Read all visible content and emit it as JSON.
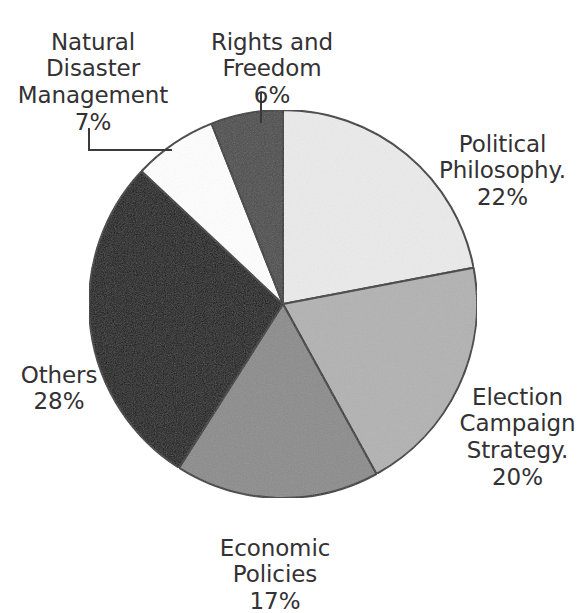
{
  "chart_data": {
    "type": "pie",
    "title": "",
    "subtitle": "",
    "xlabel": "",
    "ylabel": "",
    "legend_position": "none",
    "grid": false,
    "units": "percent",
    "start_angle_deg": 0,
    "direction": "clockwise",
    "categories": [
      "Political Philosophy.",
      "Election Campaign Strategy.",
      "Economic Policies",
      "Others",
      "Natural Disaster Management",
      "Rights and Freedom"
    ],
    "values": [
      22,
      20,
      17,
      28,
      7,
      6
    ],
    "slices": [
      {
        "id": "political-philosophy",
        "label": "Political Philosophy.",
        "percent_text": "22%",
        "value": 22,
        "color": "#ebebeb",
        "stroke": "#3a3a3a",
        "start_deg": 0,
        "end_deg": 79.2,
        "has_leader_line": false
      },
      {
        "id": "election-campaign-strategy",
        "label": "Election Campaign Strategy.",
        "percent_text": "20%",
        "value": 20,
        "color": "#b2b2b2",
        "stroke": "#3a3a3a",
        "start_deg": 79.2,
        "end_deg": 151.2,
        "has_leader_line": false
      },
      {
        "id": "economic-policies",
        "label": "Economic Policies",
        "percent_text": "17%",
        "value": 17,
        "color": "#8b8b8b",
        "stroke": "#3a3a3a",
        "start_deg": 151.2,
        "end_deg": 212.4,
        "has_leader_line": false
      },
      {
        "id": "others",
        "label": "Others",
        "percent_text": "28%",
        "value": 28,
        "color": "#141414",
        "stroke": "#3a3a3a",
        "start_deg": 212.4,
        "end_deg": 313.2,
        "has_leader_line": false
      },
      {
        "id": "natural-disaster-management",
        "label": "Natural Disaster Management",
        "percent_text": "7%",
        "value": 7,
        "color": "#ffffff",
        "stroke": "#3a3a3a",
        "start_deg": 313.2,
        "end_deg": 338.4,
        "has_leader_line": true
      },
      {
        "id": "rights-and-freedom",
        "label": "Rights and Freedom",
        "percent_text": "6%",
        "value": 6,
        "color": "#4b4b4b",
        "stroke": "#3a3a3a",
        "start_deg": 338.4,
        "end_deg": 360,
        "has_leader_line": true
      }
    ],
    "geometry": {
      "center_x": 283,
      "center_y": 304,
      "radius": 194
    }
  },
  "labels": {
    "natural_disaster": {
      "text": "Natural\nDisaster\nManagement",
      "percent": "7%"
    },
    "rights_freedom": {
      "text": "Rights and\nFreedom",
      "percent": "6%"
    },
    "political_philosophy": {
      "text": "Political\nPhilosophy.",
      "percent": "22%"
    },
    "election_campaign": {
      "text": "Election\nCampaign\nStrategy.",
      "percent": "20%"
    },
    "economic_policies": {
      "text": "Economic\nPolicies",
      "percent": "17%"
    },
    "others": {
      "text": "Others",
      "percent": "28%"
    }
  }
}
